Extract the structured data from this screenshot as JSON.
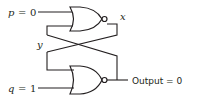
{
  "diagram": {
    "type": "NOR latch (cross-coupled NOR gates)",
    "inputs": {
      "p": {
        "name": "p",
        "eq": "=",
        "value": "0"
      },
      "q": {
        "name": "q",
        "eq": "=",
        "value": "1"
      }
    },
    "nodes": {
      "x": "x",
      "y": "y"
    },
    "output": {
      "label": "Output",
      "eq": "=",
      "value": "0",
      "text": "Output = 0"
    },
    "gates": [
      {
        "id": "top-nor",
        "type": "NOR",
        "inputs": [
          "p",
          "y"
        ],
        "output": "x"
      },
      {
        "id": "bottom-nor",
        "type": "NOR",
        "inputs": [
          "x",
          "q"
        ],
        "output": "Output"
      }
    ],
    "colors": {
      "ink": "#231f20",
      "background": "#ffffff"
    }
  }
}
